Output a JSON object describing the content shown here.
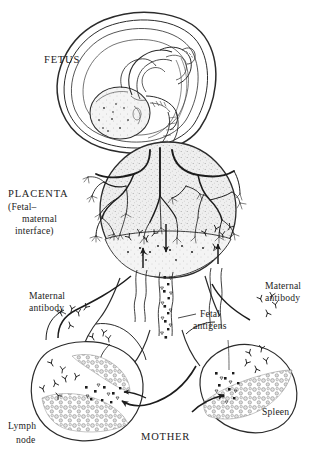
{
  "figure": {
    "type": "biomedical-illustration",
    "background_color": "#ffffff",
    "ink_color": "#1c1c1c",
    "tissue_fill": "#e9e9e9",
    "width": 321,
    "height": 463
  },
  "labels": {
    "fetus": "FETUS",
    "placenta": "PLACENTA",
    "placenta_sub_line1": "(Fetal–",
    "placenta_sub_line2": "maternal",
    "placenta_sub_line3": "interface)",
    "maternal_antibody_left_line1": "Maternal",
    "maternal_antibody_left_line2": "antibody",
    "maternal_antibody_right_line1": "Maternal",
    "maternal_antibody_right_line2": "antibody",
    "fetal_antigens_line1": "Fetal",
    "fetal_antigens_line2": "antigens",
    "lymph_node_line1": "Lymph",
    "lymph_node_line2": "node",
    "spleen": "Spleen",
    "mother": "MOTHER"
  },
  "structures": [
    {
      "name": "amniotic-sac",
      "label": "FETUS"
    },
    {
      "name": "fetus-body",
      "label": "FETUS"
    },
    {
      "name": "umbilical-cord",
      "label": ""
    },
    {
      "name": "placenta-disc",
      "label": "PLACENTA"
    },
    {
      "name": "chorionic-villi",
      "label": ""
    },
    {
      "name": "uterus-body",
      "label": ""
    },
    {
      "name": "cervical-canal",
      "label": ""
    },
    {
      "name": "maternal-lymph-node",
      "label": "Lymph node"
    },
    {
      "name": "maternal-spleen",
      "label": "Spleen"
    },
    {
      "name": "lymphatic-vessels",
      "label": ""
    }
  ],
  "flow_arrows": [
    {
      "name": "antigen-flow-down",
      "direction": "down",
      "meaning": "Fetal antigens cross into maternal circulation"
    },
    {
      "name": "antibody-flow-up-left",
      "direction": "up",
      "meaning": "Maternal antibody crosses into fetal circulation"
    },
    {
      "name": "antibody-flow-up-right",
      "direction": "up",
      "meaning": "Maternal antibody crosses into fetal circulation"
    },
    {
      "name": "antigen-to-lymph-node",
      "direction": "left",
      "meaning": "Antigens drain to maternal lymph node"
    },
    {
      "name": "antigen-to-spleen",
      "direction": "right",
      "meaning": "Antigens reach maternal spleen"
    }
  ]
}
